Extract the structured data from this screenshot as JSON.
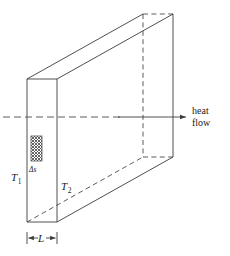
{
  "figure": {
    "type": "technical-line-diagram",
    "background_color": "#ffffff",
    "line_color": "#3c3c3c",
    "hidden_line_color": "#4a4a4a"
  },
  "labels": {
    "temperature_hot": "T",
    "temperature_hot_sub": "1",
    "temperature_cold": "T",
    "temperature_cold_sub": "2",
    "area_element": "Δs",
    "thickness": "L",
    "flow_line1": "heat",
    "flow_line2": "flow"
  },
  "geometry": {
    "front_face": {
      "top_left_x": 27,
      "top_left_y": 79,
      "top_right_x": 57,
      "top_right_y": 79,
      "bottom_left_x": 27,
      "bottom_left_y": 222,
      "bottom_right_x": 57,
      "bottom_right_y": 222
    },
    "back_face": {
      "top_left_x": 143,
      "top_left_y": 14,
      "top_right_x": 173,
      "top_right_y": 14,
      "bottom_left_x": 143,
      "bottom_left_y": 157,
      "bottom_right_x": 173,
      "bottom_right_y": 157
    },
    "hatch_rect": {
      "x": 31,
      "y": 136,
      "width": 11,
      "height": 25
    },
    "center_axis_y": 117,
    "axis_start_x": 3,
    "axis_end_x": 188,
    "dim_marker_y": 238,
    "dim_left_x": 27,
    "dim_right_x": 57
  }
}
